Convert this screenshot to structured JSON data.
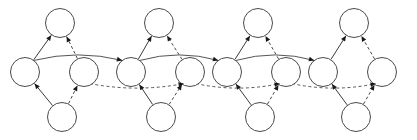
{
  "diagram": {
    "type": "directed-graph",
    "canvas": {
      "width": 417,
      "height": 140,
      "background": "#ffffff"
    },
    "style": {
      "node_fill": "#ffffff",
      "node_stroke": "#4a4a4a",
      "node_radius": 14.5,
      "edge_solid_color": "#3a3a3a",
      "edge_dashed_color": "#4a4a4a",
      "arrow_color": "#1a1a1a",
      "dash_pattern": "3 2.4"
    },
    "rows": [
      {
        "name": "top-row",
        "y": 23,
        "count": 4
      },
      {
        "name": "middle-row",
        "y": 72,
        "count": 8
      },
      {
        "name": "bottom-row",
        "y": 117,
        "count": 4
      }
    ],
    "unit_count": 4,
    "unit_spacing": 99,
    "units": [
      {
        "index": 0,
        "left_mid_x": 25,
        "right_mid_x": 84,
        "top_x": 60,
        "bottom_x": 62
      },
      {
        "index": 1,
        "left_mid_x": 131,
        "right_mid_x": 190,
        "top_x": 159,
        "bottom_x": 161
      },
      {
        "index": 2,
        "left_mid_x": 227,
        "right_mid_x": 286,
        "top_x": 258,
        "bottom_x": 260
      },
      {
        "index": 3,
        "left_mid_x": 323,
        "right_mid_x": 382,
        "top_x": 354,
        "bottom_x": 356
      }
    ],
    "nodes": [
      {
        "id": "t0",
        "row": "top",
        "unit": 0,
        "cx": 60,
        "cy": 23,
        "r": 14.5,
        "label": ""
      },
      {
        "id": "t1",
        "row": "top",
        "unit": 1,
        "cx": 159,
        "cy": 23,
        "r": 14.5,
        "label": ""
      },
      {
        "id": "t2",
        "row": "top",
        "unit": 2,
        "cx": 258,
        "cy": 23,
        "r": 14.5,
        "label": ""
      },
      {
        "id": "t3",
        "row": "top",
        "unit": 3,
        "cx": 354,
        "cy": 23,
        "r": 14.5,
        "label": ""
      },
      {
        "id": "m0",
        "row": "middle",
        "unit": 0,
        "side": "left",
        "cx": 25,
        "cy": 72,
        "r": 14.5,
        "label": ""
      },
      {
        "id": "m1",
        "row": "middle",
        "unit": 0,
        "side": "right",
        "cx": 84,
        "cy": 72,
        "r": 14.5,
        "label": ""
      },
      {
        "id": "m2",
        "row": "middle",
        "unit": 1,
        "side": "left",
        "cx": 131,
        "cy": 72,
        "r": 14.5,
        "label": ""
      },
      {
        "id": "m3",
        "row": "middle",
        "unit": 1,
        "side": "right",
        "cx": 190,
        "cy": 72,
        "r": 14.5,
        "label": ""
      },
      {
        "id": "m4",
        "row": "middle",
        "unit": 2,
        "side": "left",
        "cx": 227,
        "cy": 72,
        "r": 14.5,
        "label": ""
      },
      {
        "id": "m5",
        "row": "middle",
        "unit": 2,
        "side": "right",
        "cx": 286,
        "cy": 72,
        "r": 14.5,
        "label": ""
      },
      {
        "id": "m6",
        "row": "middle",
        "unit": 3,
        "side": "left",
        "cx": 323,
        "cy": 72,
        "r": 14.5,
        "label": ""
      },
      {
        "id": "m7",
        "row": "middle",
        "unit": 3,
        "side": "right",
        "cx": 382,
        "cy": 72,
        "r": 14.5,
        "label": ""
      },
      {
        "id": "b0",
        "row": "bottom",
        "unit": 0,
        "cx": 62,
        "cy": 117,
        "r": 14.5,
        "label": ""
      },
      {
        "id": "b1",
        "row": "bottom",
        "unit": 1,
        "cx": 161,
        "cy": 117,
        "r": 14.5,
        "label": ""
      },
      {
        "id": "b2",
        "row": "bottom",
        "unit": 2,
        "cx": 260,
        "cy": 117,
        "r": 14.5,
        "label": ""
      },
      {
        "id": "b3",
        "row": "bottom",
        "unit": 3,
        "cx": 356,
        "cy": 117,
        "r": 14.5,
        "label": ""
      }
    ],
    "edges": [
      {
        "from": "m0",
        "to": "t0",
        "style": "solid",
        "arrow": true,
        "kind": "intra-unit"
      },
      {
        "from": "m1",
        "to": "t0",
        "style": "dashed",
        "arrow": true,
        "kind": "intra-unit"
      },
      {
        "from": "b0",
        "to": "m0",
        "style": "solid",
        "arrow": true,
        "kind": "intra-unit"
      },
      {
        "from": "b0",
        "to": "m1",
        "style": "dashed",
        "arrow": true,
        "kind": "intra-unit"
      },
      {
        "from": "m2",
        "to": "t1",
        "style": "solid",
        "arrow": true,
        "kind": "intra-unit"
      },
      {
        "from": "m3",
        "to": "t1",
        "style": "dashed",
        "arrow": true,
        "kind": "intra-unit"
      },
      {
        "from": "b1",
        "to": "m2",
        "style": "solid",
        "arrow": true,
        "kind": "intra-unit"
      },
      {
        "from": "b1",
        "to": "m3",
        "style": "dashed",
        "arrow": true,
        "kind": "intra-unit"
      },
      {
        "from": "m4",
        "to": "t2",
        "style": "solid",
        "arrow": true,
        "kind": "intra-unit"
      },
      {
        "from": "m5",
        "to": "t2",
        "style": "dashed",
        "arrow": true,
        "kind": "intra-unit"
      },
      {
        "from": "b2",
        "to": "m4",
        "style": "solid",
        "arrow": true,
        "kind": "intra-unit"
      },
      {
        "from": "b2",
        "to": "m5",
        "style": "dashed",
        "arrow": true,
        "kind": "intra-unit"
      },
      {
        "from": "m6",
        "to": "t3",
        "style": "solid",
        "arrow": true,
        "kind": "intra-unit"
      },
      {
        "from": "m7",
        "to": "t3",
        "style": "dashed",
        "arrow": true,
        "kind": "intra-unit"
      },
      {
        "from": "b3",
        "to": "m6",
        "style": "solid",
        "arrow": true,
        "kind": "intra-unit"
      },
      {
        "from": "b3",
        "to": "m7",
        "style": "dashed",
        "arrow": true,
        "kind": "intra-unit"
      },
      {
        "from": "m0",
        "to": "m2",
        "style": "solid",
        "arrow": true,
        "kind": "long-top-curve"
      },
      {
        "from": "m2",
        "to": "m4",
        "style": "solid",
        "arrow": true,
        "kind": "long-top-curve"
      },
      {
        "from": "m4",
        "to": "m6",
        "style": "solid",
        "arrow": true,
        "kind": "long-top-curve"
      },
      {
        "from": "m1",
        "to": "m3",
        "style": "dashed",
        "arrow": true,
        "kind": "long-bottom-curve"
      },
      {
        "from": "m3",
        "to": "m5",
        "style": "dashed",
        "arrow": true,
        "kind": "long-bottom-curve"
      },
      {
        "from": "m5",
        "to": "m7",
        "style": "dashed",
        "arrow": true,
        "kind": "long-bottom-curve"
      }
    ]
  }
}
